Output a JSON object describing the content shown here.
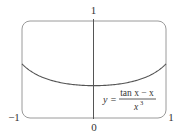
{
  "chart_data": {
    "type": "line",
    "title": "",
    "xlabel": "",
    "ylabel": "",
    "xlim": [
      -1,
      1
    ],
    "ylim": [
      0,
      1
    ],
    "x_tick_labels": [
      "-1",
      "0",
      "1"
    ],
    "y_tick_labels": [
      "1"
    ],
    "grid": false,
    "legend": null,
    "series": [
      {
        "name": "y = (tan x - x)/x^3",
        "x": [
          -1.0,
          -0.8,
          -0.6,
          -0.4,
          -0.2,
          0.0,
          0.2,
          0.4,
          0.6,
          0.8,
          1.0
        ],
        "values": [
          0.557,
          0.459,
          0.396,
          0.357,
          0.338,
          0.333,
          0.338,
          0.357,
          0.396,
          0.459,
          0.557
        ]
      }
    ],
    "annotations": [
      {
        "text": "y = (tan x − x) / x³",
        "position": "lower-right inside plot"
      }
    ]
  },
  "labels": {
    "y_top": "1",
    "x_left": "−1",
    "x_zero": "0",
    "x_right": "1",
    "formula_y": "y =",
    "formula_num": "tan x − x",
    "formula_den": "x",
    "formula_exp": "3"
  },
  "colors": {
    "frame": "#9a9a9a",
    "axis": "#555555",
    "curve": "#555555",
    "text": "#333333"
  }
}
